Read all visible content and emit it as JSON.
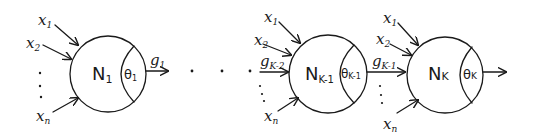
{
  "diagram": {
    "colors": {
      "ink": "#1a1a1a",
      "background": "#ffffff"
    },
    "neurons": [
      {
        "id": "N1",
        "name": "N",
        "sub": "1",
        "theta": "θ",
        "theta_sub": "1",
        "inputs": [
          {
            "t": "x",
            "s": "1"
          },
          {
            "t": "x",
            "s": "2"
          },
          {
            "t": "x",
            "s": "n"
          }
        ],
        "output": {
          "t": "g",
          "s": "1"
        }
      },
      {
        "id": "NK-1",
        "name": "N",
        "sub": "K-1",
        "theta": "θ",
        "theta_sub": "K-1",
        "inputs": [
          {
            "t": "x",
            "s": "1"
          },
          {
            "t": "x",
            "s": "2"
          },
          {
            "t": "g",
            "s": "K-2"
          },
          {
            "t": "x",
            "s": "n"
          }
        ],
        "output": {
          "t": "g",
          "s": "K-1"
        }
      },
      {
        "id": "NK",
        "name": "N",
        "sub": "K",
        "theta": "θ",
        "theta_sub": "K",
        "inputs": [
          {
            "t": "x",
            "s": "1"
          },
          {
            "t": "x",
            "s": "2"
          },
          {
            "t": "g",
            "s": "K-1"
          },
          {
            "t": "x",
            "s": "n"
          }
        ],
        "output": null
      }
    ],
    "ellipsis": "· · ·"
  }
}
